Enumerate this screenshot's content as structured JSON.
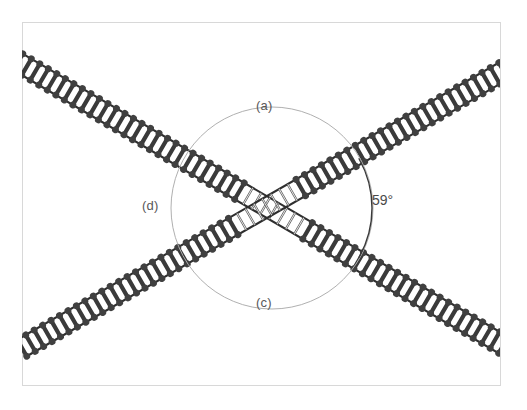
{
  "figure": {
    "type": "molecular-crossing-diagram",
    "background_color": "#ffffff",
    "border": {
      "color": "#d8d8d8",
      "x": 22,
      "y": 22,
      "width": 478,
      "height": 363
    },
    "crossing_center": {
      "x": 272,
      "y": 208
    },
    "labels": [
      {
        "id": "a",
        "text": "(a)",
        "x": 256,
        "y": 98,
        "color": "#585858"
      },
      {
        "id": "d",
        "text": "(d)",
        "x": 142,
        "y": 198,
        "color": "#585858"
      },
      {
        "id": "c",
        "text": "(c)",
        "x": 256,
        "y": 295,
        "color": "#585858"
      }
    ],
    "angle_annotation": {
      "text": "59°",
      "value": 59,
      "unit": "degrees",
      "x": 372,
      "y": 192,
      "color": "#4a4a4a",
      "arc_color": "#3a3a3a"
    },
    "guide_circle": {
      "center_x": 272,
      "center_y": 208,
      "radius": 101,
      "stroke_color": "#b0b0b0",
      "stroke_width": 1
    },
    "chains": [
      {
        "name": "chain-descending",
        "description": "ladder chain from upper-left to lower-right",
        "start": {
          "x": 18,
          "y": 62
        },
        "end": {
          "x": 512,
          "y": 350
        },
        "rung_color": "#3a3a3a",
        "bead_color": "#404040",
        "rail_color": "#2e2e2e",
        "rung_count": 58
      },
      {
        "name": "chain-ascending",
        "description": "ladder chain from lower-left to upper-right",
        "start": {
          "x": 22,
          "y": 348
        },
        "end": {
          "x": 512,
          "y": 66
        },
        "rung_color": "#3a3a3a",
        "bead_color": "#404040",
        "rail_color": "#2e2e2e",
        "rung_count": 58
      }
    ]
  },
  "chart_data": {
    "type": "diagram",
    "title": "",
    "annotations": [
      "(a)",
      "(c)",
      "(d)",
      "59°"
    ],
    "crossing_angle_degrees": 59,
    "object_count": 2,
    "objects": [
      {
        "label": "chain-descending",
        "orientation_degrees": -30.2
      },
      {
        "label": "chain-ascending",
        "orientation_degrees": 29.9
      }
    ]
  }
}
